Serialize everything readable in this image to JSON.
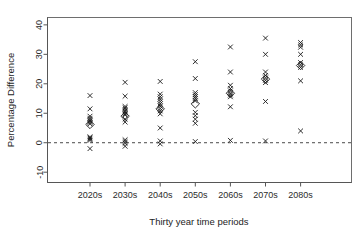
{
  "chart_data": {
    "type": "scatter",
    "title": "",
    "xlabel": "Thirty year time periods",
    "ylabel": "Percentage Difference",
    "categories": [
      "2020s",
      "2030s",
      "2040s",
      "2050s",
      "2060s",
      "2070s",
      "2080s"
    ],
    "ylim": [
      -10,
      40
    ],
    "yticks": [
      -10,
      0,
      10,
      20,
      30,
      40
    ],
    "ytick_labels": [
      "-10",
      "0",
      "10",
      "20",
      "30",
      "40"
    ],
    "xtick_labels": [
      "2020s",
      "2030s",
      "2040s",
      "2050s",
      "2060s",
      "2070s",
      "2080s"
    ],
    "grid": false,
    "legend": null,
    "annotations": [
      {
        "type": "hline",
        "y": 0,
        "style": "dashed",
        "label": "zero reference line"
      }
    ],
    "marker_styles": {
      "cross": "individual model values (x)",
      "diamond": "ensemble mean (open diamond)"
    },
    "series": [
      {
        "name": "individual values",
        "marker": "cross",
        "points": [
          {
            "category": "2020s",
            "values": [
              16.0,
              11.5,
              9.0,
              8.3,
              7.8,
              7.3,
              6.9,
              6.4,
              2.0,
              1.6,
              1.2,
              0.8,
              -2.0
            ]
          },
          {
            "category": "2030s",
            "values": [
              20.5,
              15.8,
              12.3,
              11.8,
              11.3,
              10.8,
              10.3,
              9.8,
              9.4,
              8.0,
              7.0,
              1.0,
              0.4,
              -0.2,
              -1.2
            ]
          },
          {
            "category": "2040s",
            "values": [
              20.8,
              16.5,
              15.6,
              14.8,
              14.0,
              13.2,
              12.4,
              11.6,
              10.8,
              9.8,
              5.0,
              0.6,
              -0.4
            ]
          },
          {
            "category": "2050s",
            "values": [
              27.5,
              21.8,
              17.0,
              16.3,
              15.6,
              15.0,
              14.2,
              10.3,
              9.2,
              8.0,
              6.6,
              0.4
            ]
          },
          {
            "category": "2060s",
            "values": [
              32.5,
              24.0,
              19.5,
              18.4,
              17.6,
              16.8,
              16.2,
              15.6,
              12.2,
              0.8
            ]
          },
          {
            "category": "2070s",
            "values": [
              35.5,
              30.0,
              24.0,
              22.8,
              22.0,
              21.2,
              20.4,
              14.0,
              0.6
            ]
          },
          {
            "category": "2080s",
            "values": [
              34.0,
              33.2,
              32.4,
              30.0,
              27.2,
              26.4,
              25.6,
              21.0,
              4.0
            ]
          }
        ]
      },
      {
        "name": "ensemble mean",
        "marker": "diamond",
        "points": [
          {
            "category": "2020s",
            "value": 6.2
          },
          {
            "category": "2030s",
            "value": 9.0
          },
          {
            "category": "2040s",
            "value": 11.5
          },
          {
            "category": "2050s",
            "value": 13.2
          },
          {
            "category": "2060s",
            "value": 16.8
          },
          {
            "category": "2070s",
            "value": 21.6
          },
          {
            "category": "2080s",
            "value": 26.2
          }
        ]
      }
    ]
  },
  "axes": {
    "y_title": "Percentage Difference",
    "x_title": "Thirty year time periods"
  },
  "colors": {
    "marker": "#1a1a1a",
    "frame": "#6e6e6e",
    "zero_line": "#4a4a4a",
    "background": "#ffffff"
  }
}
